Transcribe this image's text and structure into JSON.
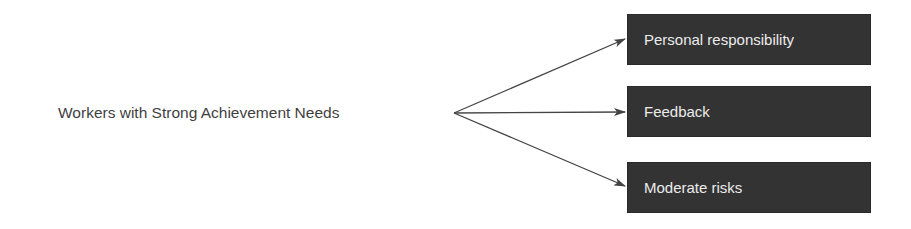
{
  "diagram": {
    "source": {
      "label": "Workers with Strong Achievement Needs"
    },
    "targets": [
      {
        "label": "Personal responsibility"
      },
      {
        "label": "Feedback"
      },
      {
        "label": "Moderate risks"
      }
    ],
    "colors": {
      "box_fill": "#333333",
      "box_text": "#ececec",
      "source_text": "#3f3f3f",
      "arrow": "#444444"
    }
  }
}
